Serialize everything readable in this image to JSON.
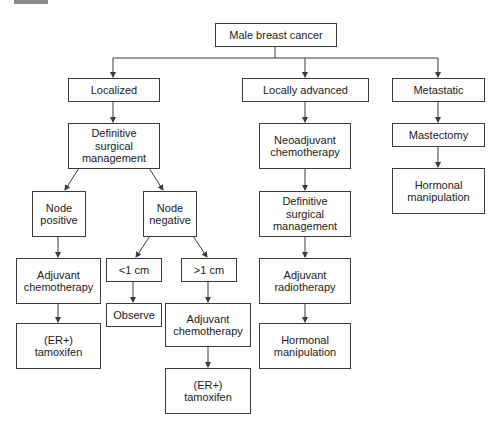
{
  "diagram": {
    "title": "Male breast cancer",
    "colors": {
      "line": "#3a3a3a",
      "text": "#1a1a1a",
      "background": "#ffffff",
      "header_bar": "#8a8a8a"
    },
    "nodes": {
      "root": "Male breast cancer",
      "localized": "Localized",
      "locally_advanced": "Locally advanced",
      "metastatic": "Metastatic",
      "loc_surgery": "Definitive\nsurgical\nmanagement",
      "node_positive": "Node\npositive",
      "node_negative": "Node\nnegative",
      "pos_adj_chemo": "Adjuvant\nchemotherapy",
      "pos_tamoxifen": "(ER+)\ntamoxifen",
      "lt1cm": "<1 cm",
      "gt1cm": ">1 cm",
      "observe": "Observe",
      "gt_adj_chemo": "Adjuvant\nchemotherapy",
      "gt_tamoxifen": "(ER+)\ntamoxifen",
      "neoadjuvant": "Neoadjuvant\nchemotherapy",
      "adv_surgery": "Definitive\nsurgical\nmanagement",
      "adj_radio": "Adjuvant\nradiotherapy",
      "adv_hormonal": "Hormonal\nmanipulation",
      "mastectomy": "Mastectomy",
      "met_hormonal": "Hormonal\nmanipulation"
    },
    "edges": [
      [
        "root",
        "localized"
      ],
      [
        "root",
        "locally_advanced"
      ],
      [
        "root",
        "metastatic"
      ],
      [
        "localized",
        "loc_surgery"
      ],
      [
        "loc_surgery",
        "node_positive"
      ],
      [
        "loc_surgery",
        "node_negative"
      ],
      [
        "node_positive",
        "pos_adj_chemo"
      ],
      [
        "pos_adj_chemo",
        "pos_tamoxifen"
      ],
      [
        "node_negative",
        "lt1cm"
      ],
      [
        "node_negative",
        "gt1cm"
      ],
      [
        "lt1cm",
        "observe"
      ],
      [
        "gt1cm",
        "gt_adj_chemo"
      ],
      [
        "gt_adj_chemo",
        "gt_tamoxifen"
      ],
      [
        "locally_advanced",
        "neoadjuvant"
      ],
      [
        "neoadjuvant",
        "adv_surgery"
      ],
      [
        "adv_surgery",
        "adj_radio"
      ],
      [
        "adj_radio",
        "adv_hormonal"
      ],
      [
        "metastatic",
        "mastectomy"
      ],
      [
        "mastectomy",
        "met_hormonal"
      ]
    ]
  }
}
